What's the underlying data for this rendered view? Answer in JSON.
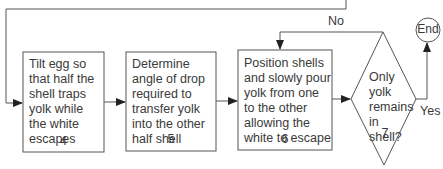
{
  "steps": [
    {
      "text": "Tilt egg so that half the shell traps yolk while the white escapes",
      "number": "4"
    },
    {
      "text": "Determine angle of drop required to transfer yolk into the other half shell",
      "number": "5"
    },
    {
      "text": "Position shells and slowly pour yolk from one to the other allowing the white to escape",
      "number": "6"
    }
  ],
  "decision": {
    "text": "Only yolk remains in shell?",
    "number": "7",
    "no_label": "No",
    "yes_label": "Yes"
  },
  "terminal": {
    "label": "End"
  }
}
